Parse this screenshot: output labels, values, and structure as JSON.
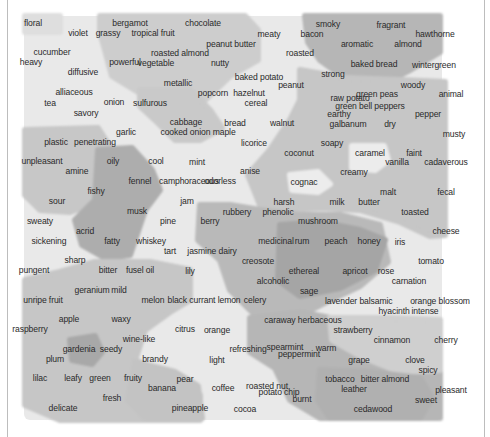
{
  "figure": {
    "kind": "hexagonal self-organizing map of odor descriptors",
    "colors": {
      "background": "#ffffff",
      "frame": "#bdbdbd",
      "shade_lightest": "#ececec",
      "shade_light": "#dcdcdc",
      "shade_mid": "#cbcbcb",
      "shade_dark": "#b3b3b3",
      "shade_darkest": "#a2a2a2",
      "text": "#2a2a2a"
    }
  },
  "labels": [
    {
      "text": "floral",
      "x": 33,
      "y": 24
    },
    {
      "text": "bergamot",
      "x": 130,
      "y": 24
    },
    {
      "text": "chocolate",
      "x": 203,
      "y": 24
    },
    {
      "text": "smoky",
      "x": 328,
      "y": 25
    },
    {
      "text": "fragrant",
      "x": 391,
      "y": 26
    },
    {
      "text": "violet",
      "x": 78,
      "y": 34
    },
    {
      "text": "grassy",
      "x": 108,
      "y": 34
    },
    {
      "text": "tropical fruit",
      "x": 153,
      "y": 34
    },
    {
      "text": "meaty",
      "x": 269,
      "y": 35
    },
    {
      "text": "bacon",
      "x": 312,
      "y": 35
    },
    {
      "text": "hawthorne",
      "x": 435,
      "y": 35
    },
    {
      "text": "peanut butter",
      "x": 231,
      "y": 45
    },
    {
      "text": "aromatic",
      "x": 357,
      "y": 45
    },
    {
      "text": "almond",
      "x": 408,
      "y": 45
    },
    {
      "text": "cucumber",
      "x": 52,
      "y": 53
    },
    {
      "text": "roasted almond",
      "x": 180,
      "y": 54
    },
    {
      "text": "roasted",
      "x": 300,
      "y": 54
    },
    {
      "text": "heavy",
      "x": 31,
      "y": 63
    },
    {
      "text": "powerful",
      "x": 125,
      "y": 63
    },
    {
      "text": "vegetable",
      "x": 156,
      "y": 64
    },
    {
      "text": "nutty",
      "x": 220,
      "y": 64
    },
    {
      "text": "baked bread",
      "x": 374,
      "y": 65
    },
    {
      "text": "wintergreen",
      "x": 434,
      "y": 66
    },
    {
      "text": "diffusive",
      "x": 83,
      "y": 73
    },
    {
      "text": "strong",
      "x": 333,
      "y": 75
    },
    {
      "text": "metallic",
      "x": 178,
      "y": 84
    },
    {
      "text": "baked potato",
      "x": 259,
      "y": 78
    },
    {
      "text": "peanut",
      "x": 291,
      "y": 86
    },
    {
      "text": "woody",
      "x": 413,
      "y": 86
    },
    {
      "text": "alliaceous",
      "x": 74,
      "y": 93
    },
    {
      "text": "popcorn",
      "x": 213,
      "y": 94
    },
    {
      "text": "hazelnut",
      "x": 249,
      "y": 94
    },
    {
      "text": "green peas",
      "x": 377,
      "y": 95
    },
    {
      "text": "animal",
      "x": 451,
      "y": 95
    },
    {
      "text": "raw potato",
      "x": 350,
      "y": 99
    },
    {
      "text": "tea",
      "x": 50,
      "y": 104
    },
    {
      "text": "onion",
      "x": 114,
      "y": 103
    },
    {
      "text": "sulfurous",
      "x": 150,
      "y": 104
    },
    {
      "text": "cereal",
      "x": 256,
      "y": 104
    },
    {
      "text": "green bell peppers",
      "x": 370,
      "y": 107
    },
    {
      "text": "savory",
      "x": 86,
      "y": 114
    },
    {
      "text": "earthy",
      "x": 339,
      "y": 115
    },
    {
      "text": "pepper",
      "x": 428,
      "y": 115
    },
    {
      "text": "cabbage",
      "x": 186,
      "y": 123
    },
    {
      "text": "bread",
      "x": 235,
      "y": 124
    },
    {
      "text": "walnut",
      "x": 282,
      "y": 124
    },
    {
      "text": "galbanum",
      "x": 348,
      "y": 125
    },
    {
      "text": "dry",
      "x": 390,
      "y": 125
    },
    {
      "text": "garlic",
      "x": 126,
      "y": 133
    },
    {
      "text": "cooked onion maple",
      "x": 198,
      "y": 133
    },
    {
      "text": "musty",
      "x": 454,
      "y": 135
    },
    {
      "text": "plastic",
      "x": 56,
      "y": 143
    },
    {
      "text": "penetrating",
      "x": 95,
      "y": 143
    },
    {
      "text": "licorice",
      "x": 254,
      "y": 144
    },
    {
      "text": "soapy",
      "x": 332,
      "y": 144
    },
    {
      "text": "coconut",
      "x": 299,
      "y": 154
    },
    {
      "text": "caramel",
      "x": 370,
      "y": 154
    },
    {
      "text": "faint",
      "x": 414,
      "y": 154
    },
    {
      "text": "unpleasant",
      "x": 42,
      "y": 162
    },
    {
      "text": "oily",
      "x": 113,
      "y": 162
    },
    {
      "text": "cool",
      "x": 156,
      "y": 162
    },
    {
      "text": "mint",
      "x": 197,
      "y": 163
    },
    {
      "text": "vanilla",
      "x": 397,
      "y": 163
    },
    {
      "text": "cadaverous",
      "x": 446,
      "y": 163
    },
    {
      "text": "amine",
      "x": 77,
      "y": 172
    },
    {
      "text": "camphoraceous",
      "x": 189,
      "y": 182
    },
    {
      "text": "odorless",
      "x": 220,
      "y": 182
    },
    {
      "text": "fennel",
      "x": 140,
      "y": 182
    },
    {
      "text": "anise",
      "x": 250,
      "y": 172
    },
    {
      "text": "cognac",
      "x": 304,
      "y": 183
    },
    {
      "text": "creamy",
      "x": 354,
      "y": 173
    },
    {
      "text": "fishy",
      "x": 96,
      "y": 192
    },
    {
      "text": "malt",
      "x": 388,
      "y": 193
    },
    {
      "text": "fecal",
      "x": 446,
      "y": 193
    },
    {
      "text": "sour",
      "x": 57,
      "y": 202
    },
    {
      "text": "jam",
      "x": 187,
      "y": 202
    },
    {
      "text": "harsh",
      "x": 284,
      "y": 203
    },
    {
      "text": "milk",
      "x": 337,
      "y": 203
    },
    {
      "text": "butter",
      "x": 369,
      "y": 203
    },
    {
      "text": "musk",
      "x": 137,
      "y": 212
    },
    {
      "text": "rubbery",
      "x": 237,
      "y": 213
    },
    {
      "text": "phenolic",
      "x": 278,
      "y": 213
    },
    {
      "text": "toasted",
      "x": 415,
      "y": 213
    },
    {
      "text": "sweaty",
      "x": 40,
      "y": 222
    },
    {
      "text": "pine",
      "x": 168,
      "y": 222
    },
    {
      "text": "berry",
      "x": 210,
      "y": 222
    },
    {
      "text": "mushroom",
      "x": 318,
      "y": 222
    },
    {
      "text": "cheese",
      "x": 446,
      "y": 232
    },
    {
      "text": "acrid",
      "x": 85,
      "y": 232
    },
    {
      "text": "fatty",
      "x": 112,
      "y": 242
    },
    {
      "text": "whiskey",
      "x": 151,
      "y": 242
    },
    {
      "text": "medicinal",
      "x": 276,
      "y": 242
    },
    {
      "text": "rum",
      "x": 302,
      "y": 242
    },
    {
      "text": "peach",
      "x": 336,
      "y": 242
    },
    {
      "text": "honey",
      "x": 369,
      "y": 242
    },
    {
      "text": "iris",
      "x": 400,
      "y": 243
    },
    {
      "text": "sickening",
      "x": 49,
      "y": 242
    },
    {
      "text": "tart",
      "x": 170,
      "y": 252
    },
    {
      "text": "jasmine dairy",
      "x": 212,
      "y": 252
    },
    {
      "text": "creosote",
      "x": 258,
      "y": 262
    },
    {
      "text": "tomato",
      "x": 431,
      "y": 262
    },
    {
      "text": "sharp",
      "x": 75,
      "y": 261
    },
    {
      "text": "pungent",
      "x": 34,
      "y": 271
    },
    {
      "text": "bitter",
      "x": 108,
      "y": 271
    },
    {
      "text": "fusel oil",
      "x": 140,
      "y": 271
    },
    {
      "text": "lily",
      "x": 190,
      "y": 272
    },
    {
      "text": "ethereal",
      "x": 304,
      "y": 272
    },
    {
      "text": "apricot",
      "x": 355,
      "y": 272
    },
    {
      "text": "rose",
      "x": 386,
      "y": 272
    },
    {
      "text": "alcoholic",
      "x": 273,
      "y": 282
    },
    {
      "text": "carnation",
      "x": 409,
      "y": 282
    },
    {
      "text": "geranium",
      "x": 92,
      "y": 291
    },
    {
      "text": "mild",
      "x": 119,
      "y": 291
    },
    {
      "text": "sage",
      "x": 309,
      "y": 292
    },
    {
      "text": "unripe fruit",
      "x": 43,
      "y": 301
    },
    {
      "text": "melon",
      "x": 153,
      "y": 301
    },
    {
      "text": "black currant lemon",
      "x": 204,
      "y": 301
    },
    {
      "text": "celery",
      "x": 255,
      "y": 301
    },
    {
      "text": "lavender",
      "x": 341,
      "y": 302
    },
    {
      "text": "balsamic",
      "x": 376,
      "y": 302
    },
    {
      "text": "orange blossom",
      "x": 440,
      "y": 302
    },
    {
      "text": "hyacinth",
      "x": 394,
      "y": 312
    },
    {
      "text": "intense",
      "x": 425,
      "y": 312
    },
    {
      "text": "caraway herbaceous",
      "x": 303,
      "y": 321
    },
    {
      "text": "apple",
      "x": 69,
      "y": 320
    },
    {
      "text": "waxy",
      "x": 121,
      "y": 320
    },
    {
      "text": "citrus",
      "x": 185,
      "y": 330
    },
    {
      "text": "orange",
      "x": 217,
      "y": 331
    },
    {
      "text": "strawberry",
      "x": 353,
      "y": 331
    },
    {
      "text": "raspberry",
      "x": 30,
      "y": 330
    },
    {
      "text": "cinnamon",
      "x": 392,
      "y": 341
    },
    {
      "text": "cherry",
      "x": 446,
      "y": 341
    },
    {
      "text": "wine-like",
      "x": 139,
      "y": 340
    },
    {
      "text": "gardenia",
      "x": 79,
      "y": 350
    },
    {
      "text": "seedy",
      "x": 111,
      "y": 350
    },
    {
      "text": "refreshing",
      "x": 248,
      "y": 350
    },
    {
      "text": "spearmint",
      "x": 285,
      "y": 348
    },
    {
      "text": "warm",
      "x": 326,
      "y": 349
    },
    {
      "text": "peppermint",
      "x": 299,
      "y": 355
    },
    {
      "text": "plum",
      "x": 55,
      "y": 360
    },
    {
      "text": "brandy",
      "x": 155,
      "y": 360
    },
    {
      "text": "light",
      "x": 217,
      "y": 361
    },
    {
      "text": "grape",
      "x": 359,
      "y": 361
    },
    {
      "text": "clove",
      "x": 415,
      "y": 361
    },
    {
      "text": "spicy",
      "x": 428,
      "y": 371
    },
    {
      "text": "lilac",
      "x": 40,
      "y": 379
    },
    {
      "text": "leafy",
      "x": 73,
      "y": 379
    },
    {
      "text": "green",
      "x": 100,
      "y": 379
    },
    {
      "text": "fruity",
      "x": 133,
      "y": 379
    },
    {
      "text": "pear",
      "x": 185,
      "y": 380
    },
    {
      "text": "tobacco",
      "x": 340,
      "y": 380
    },
    {
      "text": "bitter almond",
      "x": 385,
      "y": 380
    },
    {
      "text": "coffee",
      "x": 223,
      "y": 389
    },
    {
      "text": "roasted nut",
      "x": 267,
      "y": 387
    },
    {
      "text": "potato chip",
      "x": 279,
      "y": 393
    },
    {
      "text": "banana",
      "x": 162,
      "y": 389
    },
    {
      "text": "leather",
      "x": 354,
      "y": 390
    },
    {
      "text": "pleasant",
      "x": 451,
      "y": 391
    },
    {
      "text": "burnt",
      "x": 302,
      "y": 400
    },
    {
      "text": "sweet",
      "x": 426,
      "y": 401
    },
    {
      "text": "fresh",
      "x": 112,
      "y": 399
    },
    {
      "text": "delicate",
      "x": 63,
      "y": 409
    },
    {
      "text": "pineapple",
      "x": 190,
      "y": 409
    },
    {
      "text": "cocoa",
      "x": 245,
      "y": 410
    },
    {
      "text": "cedawood",
      "x": 373,
      "y": 410
    }
  ],
  "regions": [
    {
      "name": "floral-cluster",
      "shade": "#dedede",
      "points": "25,16 60,16 60,32 25,32"
    },
    {
      "name": "nutty-cluster",
      "shade": "#cdcdcd",
      "points": "100,16 245,16 258,30 258,60 230,76 205,100 185,118 160,112 148,98 112,76 105,50 100,32"
    },
    {
      "name": "sulfur-cluster",
      "shade": "#c9c9c9",
      "points": "140,90 190,90 210,110 222,128 200,140 175,140 155,120 140,106"
    },
    {
      "name": "smoky-cluster",
      "shade": "#b6b6b6",
      "points": "305,16 440,16 440,52 410,70 390,80 345,78 320,60 308,42"
    },
    {
      "name": "earthy-cluster",
      "shade": "#c6c6c6",
      "points": "300,70 345,78 400,80 445,82 445,235 430,236 400,222 360,210 322,208 285,210 260,205 248,175 270,150 290,120 300,100"
    },
    {
      "name": "vanilla-light-island",
      "shade": "#ececec",
      "points": "352,146 384,146 388,160 375,170 352,168"
    },
    {
      "name": "cognac-light-island",
      "shade": "#ececec",
      "points": "290,175 318,172 330,184 318,192 292,190"
    },
    {
      "name": "plastic-cluster",
      "shade": "#c7c7c7",
      "points": "25,130 98,128 112,150 100,175 90,205 70,212 40,210 25,195"
    },
    {
      "name": "musk-oily-cluster",
      "shade": "#adadad",
      "points": "98,150 132,148 152,170 160,190 145,210 130,255 105,258 82,245 75,220 95,200"
    },
    {
      "name": "medicinal-cluster",
      "shade": "#b9b9b9",
      "points": "200,205 230,205 260,210 300,215 340,215 380,225 388,262 360,286 330,300 295,318 265,325 230,290 220,260 198,240"
    },
    {
      "name": "rum-peach-cluster",
      "shade": "#a5a5a5",
      "points": "280,225 320,222 360,230 385,240 375,270 340,288 300,296 278,280"
    },
    {
      "name": "fruity-cluster",
      "shade": "#c6c6c6",
      "points": "25,280 60,272 95,262 150,262 190,270 190,300 170,312 145,330 135,360 175,380 200,395 200,420 60,420 25,405"
    },
    {
      "name": "gardenia-dark-island",
      "shade": "#a8a8a8",
      "points": "70,340 95,336 102,352 92,364 72,360"
    },
    {
      "name": "mint-cluster",
      "shade": "#b6b6b6",
      "points": "250,318 300,312 340,320 360,340 390,360 440,370 440,418 320,418 290,400 275,368 250,352"
    },
    {
      "name": "cinnamon-cluster",
      "shade": "#cfcfcf",
      "points": "330,318 390,318 440,320 440,370 400,372 360,356 332,340"
    },
    {
      "name": "banana-cluster",
      "shade": "#c3c3c3",
      "points": "135,362 175,372 198,386 202,418 145,418 128,400"
    },
    {
      "name": "tobacco-cluster",
      "shade": "#b0b0b0",
      "points": "320,370 370,372 420,378 432,398 420,418 330,418 318,400"
    }
  ]
}
